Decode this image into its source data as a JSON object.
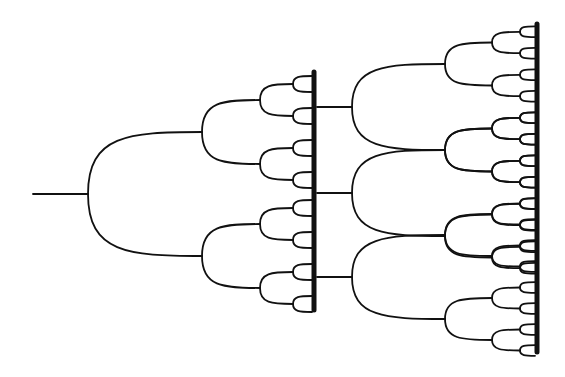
{
  "diagram": {
    "type": "binary-bifurcation-tree",
    "background": "#ffffff",
    "stroke_color": "#111111",
    "line_width": 1.8,
    "bar_width": 5,
    "left_tree": {
      "stem": {
        "x1": 33,
        "x2": 88,
        "y": 194
      },
      "levels_x": [
        88,
        202,
        260,
        293,
        312
      ],
      "root_y": 194,
      "level_offsets": [
        62,
        32,
        16,
        8
      ],
      "bar": {
        "x": 314,
        "y1": 72,
        "y2": 310
      }
    },
    "connectors": [
      {
        "x1": 317,
        "x2": 352,
        "y": 107
      },
      {
        "x1": 317,
        "x2": 352,
        "y": 193
      },
      {
        "x1": 317,
        "x2": 352,
        "y": 277
      }
    ],
    "right_trees": [
      {
        "root_y": 107,
        "levels_x": [
          352,
          445,
          492,
          520,
          535
        ],
        "level_offsets": [
          43,
          21.5,
          10.7,
          5.4
        ]
      },
      {
        "root_y": 193,
        "levels_x": [
          352,
          445,
          492,
          520,
          535
        ],
        "level_offsets": [
          43,
          21.5,
          10.7,
          5.4
        ]
      },
      {
        "root_y": 277,
        "levels_x": [
          352,
          445,
          492,
          520,
          535
        ],
        "level_offsets": [
          42,
          21,
          10.5,
          5.3
        ]
      }
    ],
    "right_bar": {
      "x": 537,
      "y1": 24,
      "y2": 352
    }
  }
}
